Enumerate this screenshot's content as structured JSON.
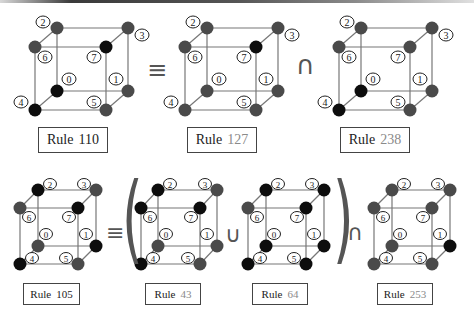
{
  "figure": {
    "rows": [
      {
        "equation": "Rule 110 ≡ Rule 127 ∩ Rule 238",
        "cubes": [
          {
            "id": "rule-110",
            "label_word": "Rule",
            "label_number": "110",
            "number_style": "dark",
            "vertex_colors": {
              "0": "black",
              "1": "gray",
              "2": "gray",
              "3": "gray",
              "4": "black",
              "5": "gray",
              "6": "gray",
              "7": "black"
            }
          },
          {
            "id": "rule-127",
            "label_word": "Rule",
            "label_number": "127",
            "number_style": "gray",
            "vertex_colors": {
              "0": "gray",
              "1": "gray",
              "2": "gray",
              "3": "gray",
              "4": "gray",
              "5": "gray",
              "6": "gray",
              "7": "black"
            }
          },
          {
            "id": "rule-238",
            "label_word": "Rule",
            "label_number": "238",
            "number_style": "gray",
            "vertex_colors": {
              "0": "black",
              "1": "gray",
              "2": "gray",
              "3": "gray",
              "4": "black",
              "5": "gray",
              "6": "gray",
              "7": "gray"
            }
          }
        ],
        "operators": [
          "≡",
          "∩"
        ]
      },
      {
        "equation": "Rule 105 ≡ ( Rule 43 ∪ Rule 64 ) ∩ Rule 253",
        "cubes": [
          {
            "id": "rule-105",
            "label_word": "Rule",
            "label_number": "105",
            "number_style": "dark",
            "vertex_colors": {
              "0": "gray",
              "1": "black",
              "2": "black",
              "3": "gray",
              "4": "black",
              "5": "gray",
              "6": "gray",
              "7": "black"
            }
          },
          {
            "id": "rule-43",
            "label_word": "Rule",
            "label_number": "43",
            "number_style": "gray",
            "vertex_colors": {
              "0": "gray",
              "1": "gray",
              "2": "black",
              "3": "gray",
              "4": "black",
              "5": "gray",
              "6": "black",
              "7": "black"
            }
          },
          {
            "id": "rule-64",
            "label_word": "Rule",
            "label_number": "64",
            "number_style": "gray",
            "vertex_colors": {
              "0": "black",
              "1": "black",
              "2": "black",
              "3": "black",
              "4": "black",
              "5": "black",
              "6": "gray",
              "7": "black"
            }
          },
          {
            "id": "rule-253",
            "label_word": "Rule",
            "label_number": "253",
            "number_style": "gray",
            "vertex_colors": {
              "0": "gray",
              "1": "black",
              "2": "gray",
              "3": "gray",
              "4": "gray",
              "5": "gray",
              "6": "gray",
              "7": "gray"
            }
          }
        ],
        "operators": [
          "≡",
          "(",
          "∪",
          ")",
          "∩"
        ]
      }
    ],
    "vertex_labels": [
      "0",
      "1",
      "2",
      "3",
      "4",
      "5",
      "6",
      "7"
    ],
    "colors": {
      "black": "#0d0d0d",
      "gray": "#4a4a4a",
      "edge": "#777777",
      "label_ring": "#222222"
    }
  },
  "labels": {
    "r110_word": "Rule",
    "r110_num": "110",
    "r127_word": "Rule",
    "r127_num": "127",
    "r238_word": "Rule",
    "r238_num": "238",
    "r105_word": "Rule",
    "r105_num": "105",
    "r43_word": "Rule",
    "r43_num": "43",
    "r64_word": "Rule",
    "r64_num": "64",
    "r253_word": "Rule",
    "r253_num": "253"
  },
  "operators": {
    "equiv": "≡",
    "intersect": "∩",
    "union": "∪",
    "lparen": "(",
    "rparen": ")"
  }
}
